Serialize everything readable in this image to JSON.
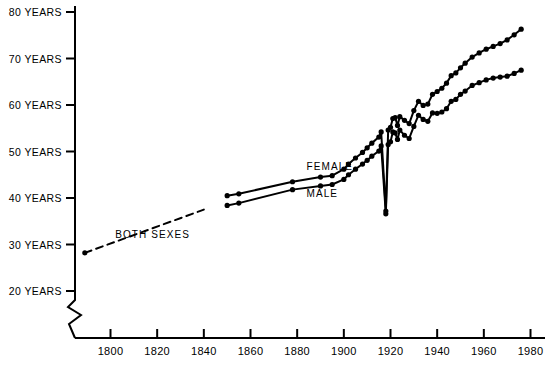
{
  "chart_data": {
    "type": "line",
    "title": "",
    "xlabel": "",
    "ylabel": "",
    "xlim": [
      1780,
      1985
    ],
    "ylim": [
      18,
      82
    ],
    "grid": false,
    "legend_position": "inline-annotations",
    "y_axis_broken_below": 20,
    "x_ticks": [
      1800,
      1820,
      1840,
      1860,
      1880,
      1900,
      1920,
      1940,
      1960,
      1980
    ],
    "x_tick_labels": [
      "1800",
      "1820",
      "1840",
      "1860",
      "1880",
      "1900",
      "1920",
      "1940",
      "1960",
      "1980"
    ],
    "y_ticks": [
      20,
      30,
      40,
      50,
      60,
      70,
      80
    ],
    "y_tick_labels": [
      "20 YEARS",
      "30 YEARS",
      "40 YEARS",
      "50 YEARS",
      "60 YEARS",
      "70 YEARS",
      "80 YEARS"
    ],
    "series": [
      {
        "name": "BOTH SEXES",
        "style": "dashed",
        "markers": "start-only",
        "x": [
          1789,
          1840
        ],
        "values": [
          28.2,
          37.5
        ]
      },
      {
        "name": "FEMALE",
        "style": "solid",
        "markers": "circle",
        "x": [
          1850,
          1855,
          1878,
          1890,
          1895,
          1900,
          1902,
          1905,
          1908,
          1910,
          1912,
          1915,
          1916,
          1918,
          1919,
          1920,
          1921,
          1922,
          1923,
          1924,
          1926,
          1928,
          1930,
          1932,
          1934,
          1936,
          1938,
          1940,
          1942,
          1944,
          1946,
          1948,
          1950,
          1952,
          1955,
          1958,
          1961,
          1964,
          1967,
          1970,
          1973,
          1976
        ],
        "values": [
          40.5,
          40.9,
          43.5,
          44.5,
          44.8,
          46.2,
          47.3,
          48.6,
          49.8,
          50.8,
          51.8,
          53.1,
          54.2,
          37.2,
          54.6,
          55.2,
          57.1,
          57.3,
          55.6,
          57.5,
          56.7,
          56.0,
          58.8,
          60.8,
          59.9,
          60.2,
          62.3,
          62.9,
          63.6,
          64.7,
          66.3,
          66.9,
          68.0,
          69.0,
          70.3,
          71.2,
          72.0,
          72.6,
          73.2,
          74.0,
          75.1,
          76.3
        ]
      },
      {
        "name": "MALE",
        "style": "solid",
        "markers": "circle",
        "x": [
          1850,
          1855,
          1878,
          1890,
          1895,
          1900,
          1902,
          1905,
          1908,
          1910,
          1912,
          1915,
          1916,
          1918,
          1919,
          1920,
          1921,
          1922,
          1923,
          1924,
          1926,
          1928,
          1930,
          1932,
          1934,
          1936,
          1938,
          1940,
          1942,
          1944,
          1946,
          1948,
          1950,
          1952,
          1955,
          1958,
          1961,
          1964,
          1967,
          1970,
          1973,
          1976
        ],
        "values": [
          38.4,
          38.9,
          41.8,
          42.6,
          42.9,
          44.0,
          45.0,
          46.2,
          47.3,
          48.1,
          49.0,
          50.1,
          51.2,
          36.6,
          51.5,
          52.1,
          54.2,
          54.0,
          52.6,
          54.6,
          53.5,
          52.8,
          55.4,
          57.8,
          56.9,
          56.5,
          58.3,
          58.2,
          58.5,
          59.2,
          60.8,
          61.2,
          62.3,
          63.0,
          64.2,
          64.8,
          65.4,
          65.8,
          66.0,
          66.2,
          66.8,
          67.5
        ]
      }
    ],
    "annotations": [
      {
        "text": "BOTH SEXES",
        "x": 1802,
        "y": 31.5
      },
      {
        "text": "FEMALE",
        "x": 1884,
        "y": 46.0
      },
      {
        "text": "MALE",
        "x": 1884,
        "y": 40.2
      }
    ]
  }
}
